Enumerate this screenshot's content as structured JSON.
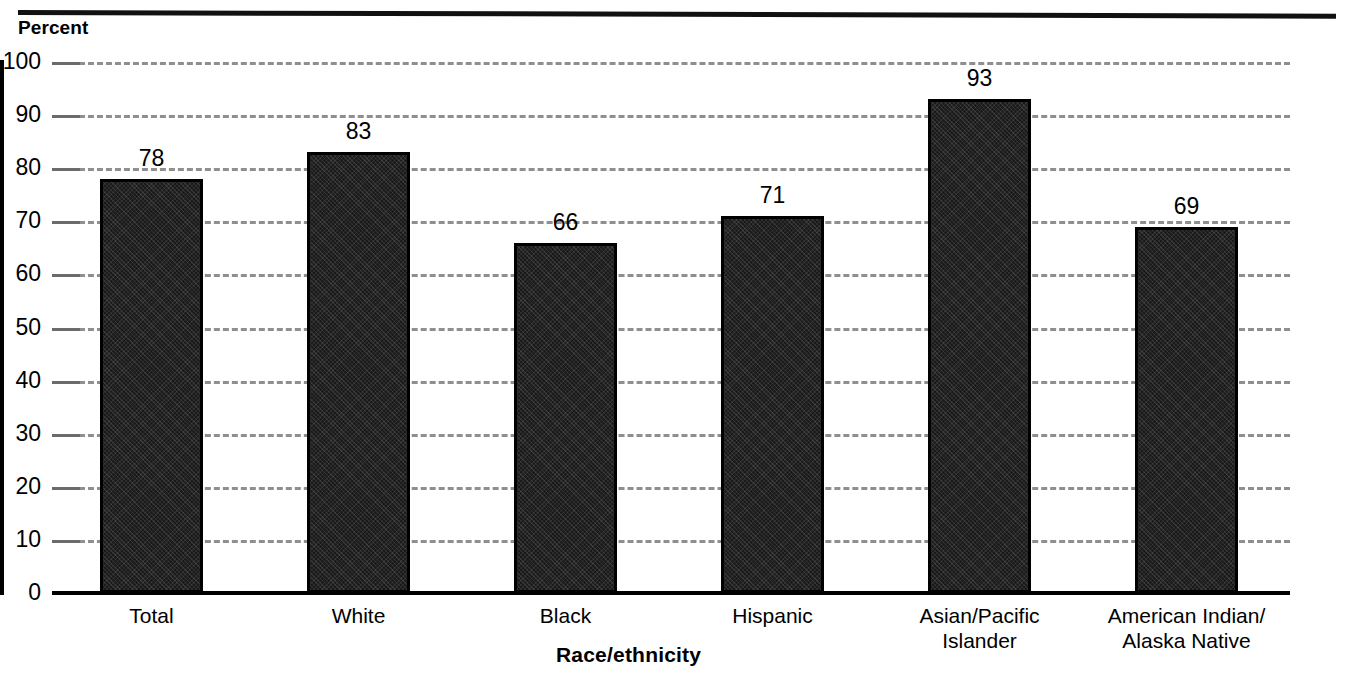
{
  "chart_data": {
    "type": "bar",
    "title": "",
    "subtitle": "",
    "xlabel": "Race/ethnicity",
    "ylabel": "Percent",
    "categories": [
      "Total",
      "White",
      "Black",
      "Hispanic",
      "Asian/Pacific\nIslander",
      "American Indian/\nAlaska Native"
    ],
    "values": [
      78,
      83,
      66,
      71,
      93,
      69
    ],
    "data_labels": [
      "78",
      "83",
      "66",
      "71",
      "93",
      "69"
    ],
    "ylim": [
      0,
      100
    ],
    "ytick_values": [
      0,
      10,
      20,
      30,
      40,
      50,
      60,
      70,
      80,
      90,
      100
    ],
    "ytick_labels": [
      "0",
      "10",
      "20",
      "30",
      "40",
      "50",
      "60",
      "70",
      "80",
      "90",
      "100"
    ],
    "grid": "horizontal-dashed",
    "legend": "none",
    "bar_color": "#1a1a1a",
    "bar_edge_color": "#000000",
    "gridline_color": "#8f8f8f",
    "axis_color": "#000000",
    "background_color": "#ffffff"
  }
}
